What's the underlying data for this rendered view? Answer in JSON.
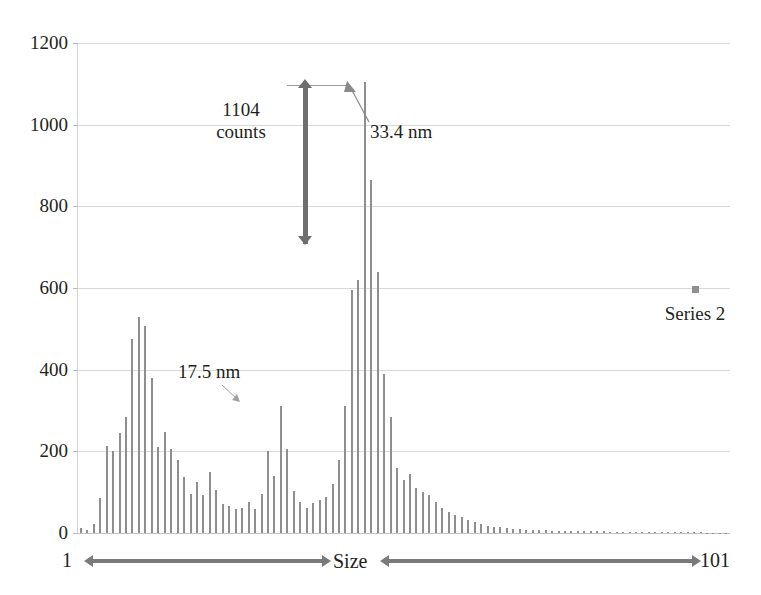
{
  "chart_data": {
    "type": "bar",
    "title": "",
    "subtitle": "",
    "xlabel": "Size",
    "ylabel": "",
    "xlim": [
      1,
      101
    ],
    "ylim": [
      0,
      1200
    ],
    "grid": true,
    "legend_position": "right",
    "x_axis_start_label": "1",
    "x_axis_end_label": "101",
    "y_ticks": [
      0,
      200,
      400,
      600,
      800,
      1000,
      1200
    ],
    "y_tick_labels": [
      "0",
      "200",
      "400",
      "600",
      "800",
      "1000",
      "1200"
    ],
    "series": [
      {
        "name": "Series 2",
        "color": "#8e8e8e",
        "categories": [
          1,
          2,
          3,
          4,
          5,
          6,
          7,
          8,
          9,
          10,
          11,
          12,
          13,
          14,
          15,
          16,
          17,
          18,
          19,
          20,
          21,
          22,
          23,
          24,
          25,
          26,
          27,
          28,
          29,
          30,
          31,
          32,
          33,
          34,
          35,
          36,
          37,
          38,
          39,
          40,
          41,
          42,
          43,
          44,
          45,
          46,
          47,
          48,
          49,
          50,
          51,
          52,
          53,
          54,
          55,
          56,
          57,
          58,
          59,
          60,
          61,
          62,
          63,
          64,
          65,
          66,
          67,
          68,
          69,
          70,
          71,
          72,
          73,
          74,
          75,
          76,
          77,
          78,
          79,
          80,
          81,
          82,
          83,
          84,
          85,
          86,
          87,
          88,
          89,
          90,
          91,
          92,
          93,
          94,
          95,
          96,
          97,
          98,
          99,
          100,
          101
        ],
        "values": [
          12,
          8,
          22,
          85,
          212,
          200,
          246,
          283,
          476,
          530,
          508,
          380,
          210,
          248,
          205,
          180,
          137,
          96,
          126,
          92,
          150,
          106,
          72,
          66,
          60,
          62,
          75,
          60,
          95,
          200,
          140,
          312,
          205,
          102,
          75,
          62,
          74,
          80,
          88,
          120,
          180,
          310,
          596,
          620,
          1104,
          865,
          640,
          390,
          285,
          160,
          130,
          145,
          110,
          100,
          92,
          75,
          62,
          52,
          44,
          40,
          32,
          26,
          22,
          18,
          15,
          14,
          12,
          10,
          9,
          8,
          8,
          7,
          7,
          6,
          6,
          5,
          5,
          5,
          4,
          4,
          4,
          4,
          3,
          3,
          3,
          3,
          3,
          3,
          2,
          2,
          2,
          2,
          2,
          2,
          2,
          2,
          2,
          1,
          1,
          1,
          1
        ]
      }
    ],
    "annotations": [
      {
        "id": "counts-measure",
        "line1": "1104",
        "line2": "counts"
      },
      {
        "id": "peak-33",
        "text": "33.4 nm"
      },
      {
        "id": "peak-17",
        "text": "17.5 nm"
      }
    ]
  },
  "legend": {
    "marker_color": "#909090",
    "label": "Series 2"
  },
  "axis": {
    "x_start": "1",
    "x_end": "101",
    "x_title": "Size"
  },
  "annotations": {
    "counts_value": "1104",
    "counts_unit": "counts",
    "peak_large": "33.4 nm",
    "peak_small": "17.5 nm"
  }
}
